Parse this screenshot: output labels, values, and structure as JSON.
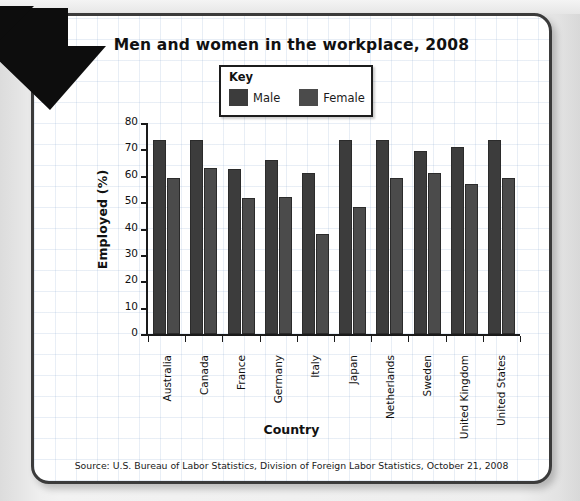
{
  "chart_data": {
    "type": "bar",
    "title": "Men and women in the workplace, 2008",
    "xlabel": "Country",
    "ylabel": "Employed (%)",
    "ylim": [
      0,
      80
    ],
    "ytick_step": 10,
    "yticks": [
      "80",
      "70",
      "60",
      "50",
      "40",
      "30",
      "20",
      "10",
      "0"
    ],
    "grid": false,
    "legend_position": "top-center",
    "legend_title": "Key",
    "categories": [
      "Australia",
      "Canada",
      "France",
      "Germany",
      "Italy",
      "Japan",
      "Netherlands",
      "Sweden",
      "United Kingdom",
      "United States"
    ],
    "series": [
      {
        "name": "Male",
        "color": "#3c3c3c",
        "values": [
          73.5,
          73.5,
          62.5,
          66,
          61,
          73.5,
          73.5,
          69.5,
          71,
          73.5
        ]
      },
      {
        "name": "Female",
        "color": "#4b4b4b",
        "values": [
          59,
          63,
          51.5,
          52,
          38,
          48,
          59,
          61,
          57,
          59
        ]
      }
    ],
    "source": "Source: U.S. Bureau of Labor Statistics, Division of Foreign Labor Statistics, October 21, 2008"
  },
  "decor": {
    "arrow_name": "down-right-arrow-graphic"
  }
}
